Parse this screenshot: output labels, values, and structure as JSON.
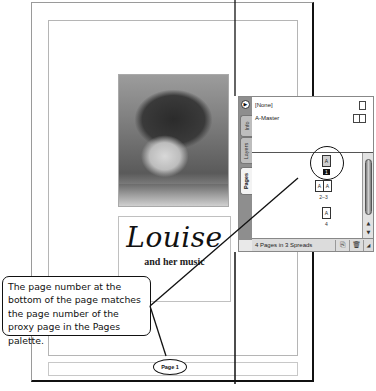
{
  "document": {
    "title_script": "Louise",
    "title_sub": "and her music",
    "page_number_label": "Page 1",
    "photo_alt": "portrait-photo"
  },
  "palette": {
    "menu_icon": "triangle-right",
    "tabs": [
      {
        "label": "Info",
        "active": false
      },
      {
        "label": "Layers",
        "active": false
      },
      {
        "label": "Pages",
        "active": true
      }
    ],
    "masters": [
      {
        "label": "[None]",
        "icon": "single-page-icon"
      },
      {
        "label": "A-Master",
        "icon": "spread-icon"
      }
    ],
    "pages": [
      {
        "pages": [
          "A"
        ],
        "label": "1",
        "selected": true
      },
      {
        "pages": [
          "A",
          "A"
        ],
        "label": "2–3",
        "selected": false
      },
      {
        "pages": [
          "A"
        ],
        "label": "4",
        "selected": false
      }
    ],
    "status": "4 Pages in 3 Spreads",
    "buttons": {
      "new_page": "new-page-icon",
      "delete": "trash-icon",
      "resize": "resize-grip-icon"
    },
    "scroll": {
      "up": "▲",
      "down": "▼"
    }
  },
  "callout": {
    "text": "The page number at the bottom of the page matches the page number of the proxy page in the Pages palette."
  },
  "colors": {
    "palette_bg": "#e9e9e9",
    "tab_strip": "#8e8e8e",
    "outline": "#111111",
    "guide": "#b5b5b5"
  }
}
